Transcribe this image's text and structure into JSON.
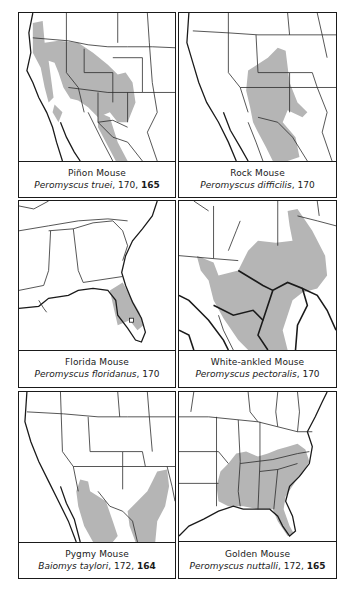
{
  "page": {
    "type": "field-guide range map plate",
    "panels": [
      {
        "id": "pinon-mouse",
        "common_name": "Piñon Mouse",
        "scientific_name": "Peromyscus truei",
        "text_page": "170",
        "plate_page": "165",
        "region_shown": "Western United States and northern Mexico",
        "range_color": "#b5b5b5"
      },
      {
        "id": "rock-mouse",
        "common_name": "Rock Mouse",
        "scientific_name": "Peromyscus difficilis",
        "text_page": "170",
        "plate_page": null,
        "region_shown": "Southwestern United States and Mexico",
        "range_color": "#b5b5b5"
      },
      {
        "id": "florida-mouse",
        "common_name": "Florida Mouse",
        "scientific_name": "Peromyscus floridanus",
        "text_page": "170",
        "plate_page": null,
        "region_shown": "Southeastern United States / Florida",
        "range_color": "#b5b5b5"
      },
      {
        "id": "white-ankled-mouse",
        "common_name": "White-ankled Mouse",
        "scientific_name": "Peromyscus pectoralis",
        "text_page": "170",
        "plate_page": null,
        "region_shown": "Texas and northern Mexico",
        "range_color": "#b5b5b5"
      },
      {
        "id": "pygmy-mouse",
        "common_name": "Pygmy Mouse",
        "scientific_name": "Baiomys taylori",
        "text_page": "172",
        "plate_page": "164",
        "region_shown": "Southwestern United States and Mexico",
        "range_color": "#b5b5b5"
      },
      {
        "id": "golden-mouse",
        "common_name": "Golden Mouse",
        "scientific_name": "Peromyscus nuttalli",
        "text_page": "172",
        "plate_page": "165",
        "region_shown": "Eastern United States",
        "range_color": "#b5b5b5"
      }
    ]
  },
  "p1": {
    "common": "Piñon Mouse",
    "latin": "Peromyscus truei",
    "pages": ", 170, ",
    "bold": "165"
  },
  "p2": {
    "common": "Rock Mouse",
    "latin": "Peromyscus difficilis",
    "pages": ", 170",
    "bold": ""
  },
  "p3": {
    "common": "Florida Mouse",
    "latin": "Peromyscus floridanus",
    "pages": ", 170",
    "bold": ""
  },
  "p4": {
    "common": "White-ankled Mouse",
    "latin": "Peromyscus pectoralis",
    "pages": ", 170",
    "bold": ""
  },
  "p5": {
    "common": "Pygmy Mouse",
    "latin": "Baiomys taylori",
    "pages": ", 172, ",
    "bold": "164"
  },
  "p6": {
    "common": "Golden Mouse",
    "latin": "Peromyscus nuttalli",
    "pages": ", 172, ",
    "bold": "165"
  }
}
